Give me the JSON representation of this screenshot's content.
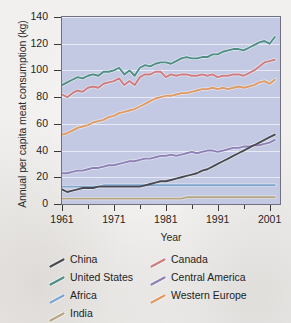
{
  "chart_data": {
    "type": "line",
    "title": "",
    "xlabel": "Year",
    "ylabel": "Annual per capita meat consumption (kg)",
    "xlim": [
      1961,
      2003
    ],
    "ylim": [
      0,
      140
    ],
    "ytick_labels": [
      "0",
      "20",
      "40",
      "60",
      "80",
      "100",
      "120",
      "140"
    ],
    "yticks": [
      0,
      20,
      40,
      60,
      80,
      100,
      120,
      140
    ],
    "xtick_labels": [
      "1961",
      "1971",
      "1981",
      "1991",
      "2001"
    ],
    "xticks": [
      1961,
      1971,
      1981,
      1991,
      2001
    ],
    "xminorticks": [
      1966,
      1976,
      1986,
      1996
    ],
    "grid": "horizontal-white",
    "legend_position": "below",
    "plot_background": "#c3c9e2",
    "x": [
      1961,
      1962,
      1963,
      1964,
      1965,
      1966,
      1967,
      1968,
      1969,
      1970,
      1971,
      1972,
      1973,
      1974,
      1975,
      1976,
      1977,
      1978,
      1979,
      1980,
      1981,
      1982,
      1983,
      1984,
      1985,
      1986,
      1987,
      1988,
      1989,
      1990,
      1991,
      1992,
      1993,
      1994,
      1995,
      1996,
      1997,
      1998,
      1999,
      2000,
      2001,
      2002
    ],
    "series": [
      {
        "name": "United States",
        "color": "#4e8f85",
        "values": [
          89,
          91,
          93,
          95,
          94,
          96,
          97,
          96,
          99,
          99,
          100,
          102,
          97,
          100,
          96,
          102,
          104,
          103,
          105,
          106,
          106,
          105,
          107,
          109,
          110,
          109,
          109,
          110,
          110,
          112,
          112,
          114,
          115,
          116,
          116,
          115,
          117,
          119,
          121,
          122,
          120,
          125
        ]
      },
      {
        "name": "Canada",
        "color": "#cf7c80",
        "values": [
          82,
          80,
          83,
          85,
          84,
          87,
          88,
          87,
          90,
          91,
          92,
          94,
          89,
          92,
          89,
          95,
          97,
          97,
          99,
          99,
          95,
          97,
          96,
          97,
          97,
          96,
          96,
          97,
          96,
          97,
          95,
          96,
          96,
          97,
          97,
          96,
          98,
          100,
          103,
          106,
          107,
          108
        ]
      },
      {
        "name": "Western Europe",
        "color": "#e09a63",
        "values": [
          52,
          53,
          55,
          57,
          58,
          59,
          61,
          62,
          63,
          65,
          66,
          68,
          69,
          70,
          71,
          73,
          75,
          77,
          79,
          80,
          81,
          81,
          82,
          83,
          83,
          84,
          85,
          86,
          86,
          87,
          86,
          87,
          86,
          87,
          88,
          87,
          88,
          89,
          91,
          92,
          90,
          93
        ]
      },
      {
        "name": "Central America",
        "color": "#8c80b4",
        "values": [
          23,
          23,
          24,
          25,
          25,
          26,
          27,
          27,
          28,
          29,
          29,
          30,
          31,
          32,
          32,
          33,
          34,
          34,
          35,
          36,
          36,
          37,
          36,
          37,
          38,
          39,
          38,
          39,
          40,
          40,
          39,
          40,
          41,
          42,
          42,
          43,
          43,
          44,
          44,
          45,
          46,
          48
        ]
      },
      {
        "name": "China",
        "color": "#4a4a52",
        "values": [
          11,
          9,
          10,
          11,
          12,
          12,
          12,
          13,
          13,
          13,
          13,
          13,
          13,
          13,
          13,
          13,
          14,
          15,
          16,
          17,
          17,
          18,
          19,
          20,
          21,
          22,
          23,
          25,
          26,
          28,
          30,
          32,
          34,
          36,
          38,
          40,
          42,
          44,
          46,
          48,
          50,
          52
        ]
      },
      {
        "name": "Africa",
        "color": "#7fa5cd",
        "values": [
          13,
          13,
          13,
          13,
          13,
          13,
          13,
          13,
          14,
          14,
          14,
          14,
          14,
          14,
          14,
          14,
          14,
          14,
          14,
          14,
          14,
          14,
          14,
          14,
          14,
          14,
          14,
          14,
          14,
          14,
          14,
          14,
          14,
          14,
          14,
          14,
          14,
          14,
          14,
          14,
          14,
          14
        ]
      },
      {
        "name": "India",
        "color": "#b5a681",
        "values": [
          4,
          4,
          4,
          4,
          4,
          4,
          4,
          4,
          4,
          4,
          4,
          4,
          4,
          4,
          4,
          4,
          4,
          4,
          4,
          4,
          4,
          4,
          4,
          4,
          5,
          5,
          5,
          5,
          5,
          5,
          5,
          5,
          5,
          5,
          5,
          5,
          5,
          5,
          5,
          5,
          5,
          5
        ]
      }
    ],
    "legend": [
      {
        "label": "China",
        "color": "#4a4a52"
      },
      {
        "label": "Canada",
        "color": "#cf7c80"
      },
      {
        "label": "United States",
        "color": "#4e8f85"
      },
      {
        "label": "Central America",
        "color": "#8c80b4"
      },
      {
        "label": "Africa",
        "color": "#7fa5cd"
      },
      {
        "label": "Western Europe",
        "color": "#e09a63"
      },
      {
        "label": "India",
        "color": "#b5a681"
      }
    ]
  }
}
